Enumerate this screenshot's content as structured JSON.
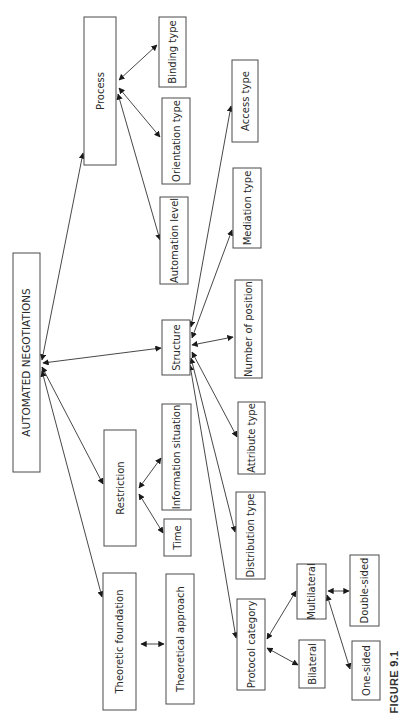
{
  "diagram": {
    "caption": "FIGURE 9.1",
    "orientation": "rotated 90° counter-clockwise",
    "root": "AUTOMATED NEGOTIATIONS",
    "nodes": {
      "root": "AUTOMATED NEGOTIATIONS",
      "process": "Process",
      "binding_type": "Binding type",
      "orientation_type": "Orientation type",
      "automation_level": "Automation level",
      "structure": "Structure",
      "access_type": "Access type",
      "mediation_type": "Mediation type",
      "number_of_position": "Number of position",
      "attribute_type": "Attribute type",
      "distribution_type": "Distribution type",
      "protocol_category": "Protocol category",
      "multilateral": "Multilateral",
      "bilateral": "Bilateral",
      "double_sided": "Double-sided",
      "one_sided": "One-sided",
      "restriction": "Restriction",
      "information_situation": "Information situation",
      "time": "Time",
      "theoretic_foundation": "Theoretic foundation",
      "theoretical_approach": "Theoretical approach"
    },
    "edges": [
      {
        "from": "root",
        "to": "process",
        "arrow": "both"
      },
      {
        "from": "root",
        "to": "structure",
        "arrow": "both"
      },
      {
        "from": "root",
        "to": "restriction",
        "arrow": "both"
      },
      {
        "from": "root",
        "to": "theoretic_foundation",
        "arrow": "both"
      },
      {
        "from": "process",
        "to": "binding_type",
        "arrow": "both"
      },
      {
        "from": "process",
        "to": "orientation_type",
        "arrow": "both"
      },
      {
        "from": "process",
        "to": "automation_level",
        "arrow": "both"
      },
      {
        "from": "structure",
        "to": "access_type",
        "arrow": "both"
      },
      {
        "from": "structure",
        "to": "mediation_type",
        "arrow": "both"
      },
      {
        "from": "structure",
        "to": "number_of_position",
        "arrow": "both"
      },
      {
        "from": "structure",
        "to": "attribute_type",
        "arrow": "both"
      },
      {
        "from": "structure",
        "to": "distribution_type",
        "arrow": "both"
      },
      {
        "from": "structure",
        "to": "protocol_category",
        "arrow": "both"
      },
      {
        "from": "protocol_category",
        "to": "multilateral",
        "arrow": "both"
      },
      {
        "from": "protocol_category",
        "to": "bilateral",
        "arrow": "both"
      },
      {
        "from": "multilateral",
        "to": "double_sided",
        "arrow": "both"
      },
      {
        "from": "multilateral",
        "to": "one_sided",
        "arrow": "both"
      },
      {
        "from": "restriction",
        "to": "information_situation",
        "arrow": "both"
      },
      {
        "from": "restriction",
        "to": "time",
        "arrow": "both"
      },
      {
        "from": "theoretic_foundation",
        "to": "theoretical_approach",
        "arrow": "both"
      }
    ]
  }
}
